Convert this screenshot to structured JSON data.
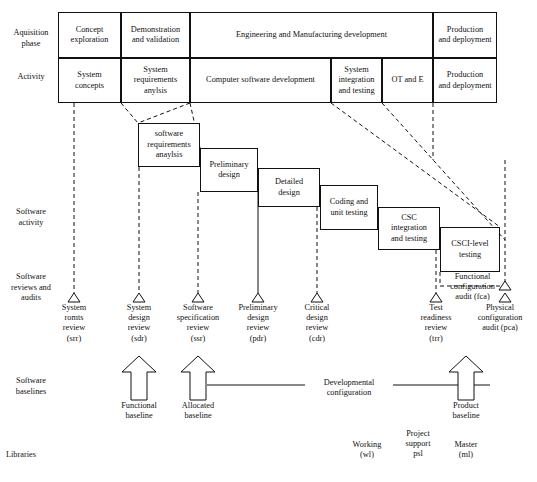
{
  "diagram": {
    "row_labels": {
      "acquisition_phase": "Aquisition\nphase",
      "activity": "Activity",
      "software_activity": "Software\nactivity",
      "reviews_audits": "Software\nreviews and\naudits",
      "baselines": "Software\nbaselines",
      "libraries": "Libraries"
    },
    "acquisition_phases": [
      {
        "label": "Concept\nexploration",
        "x": 58,
        "w": 63
      },
      {
        "label": "Demonstration\nand validation",
        "x": 121,
        "w": 69
      },
      {
        "label": "Engineering and Manufacturing development",
        "x": 190,
        "w": 243
      },
      {
        "label": "Production\nand deployment",
        "x": 433,
        "w": 64
      }
    ],
    "activities": [
      {
        "label": "System\nconcepts",
        "x": 58,
        "w": 63
      },
      {
        "label": "System\nrequirements\nanylsis",
        "x": 121,
        "w": 69
      },
      {
        "label": "Computer software development",
        "x": 190,
        "w": 141
      },
      {
        "label": "System\nintegration\nand testing",
        "x": 331,
        "w": 51
      },
      {
        "label": "OT and E",
        "x": 382,
        "w": 51
      },
      {
        "label": "Production\nand deployment",
        "x": 433,
        "w": 64
      }
    ],
    "software_activities": [
      {
        "label": "software\nrequirements\nanaylsis",
        "x": 138,
        "y": 123,
        "w": 62,
        "h": 44
      },
      {
        "label": "Preliminary\ndesign",
        "x": 200,
        "y": 148,
        "w": 58,
        "h": 44
      },
      {
        "label": "Detailed\ndesign",
        "x": 258,
        "y": 168,
        "w": 62,
        "h": 39
      },
      {
        "label": "Coding and\nunit testing",
        "x": 320,
        "y": 185,
        "w": 58,
        "h": 45
      },
      {
        "label": "CSC\nintegration\nand testing",
        "x": 378,
        "y": 207,
        "w": 62,
        "h": 43
      },
      {
        "label": "CSCI-level\ntesting",
        "x": 440,
        "y": 227,
        "w": 60,
        "h": 45
      }
    ],
    "reviews": [
      {
        "label": "System\nromts\nreview\n(srr)",
        "x": 74,
        "y": 303
      },
      {
        "label": "System\ndesign\nreview\n(sdr)",
        "x": 139,
        "y": 303
      },
      {
        "label": "Software\nspecification\nreview\n(ssr)",
        "x": 198,
        "y": 303
      },
      {
        "label": "Preliminary\ndesign\nreview\n(pdr)",
        "x": 258,
        "y": 303
      },
      {
        "label": "Critical\ndesign\nreview\n(cdr)",
        "x": 317,
        "y": 303
      },
      {
        "label": "Test\nreadiness\nreview\n(trr)",
        "x": 436,
        "y": 303
      },
      {
        "label": "Physical\nconfiguration\naudit (pca)",
        "x": 500,
        "y": 303
      }
    ],
    "fca_label": "Functional\nconfiguration\naudit (fca)",
    "baselines": [
      {
        "label": "Functional\nbaseline",
        "x": 139
      },
      {
        "label": "Allocated\nbaseline",
        "x": 198
      },
      {
        "label": "Product\nbaseline",
        "x": 466
      }
    ],
    "developmental_configuration": "Developmental\nconfiguration",
    "libraries": [
      {
        "label": "Working\n(wl)",
        "x": 367
      },
      {
        "label": "Project\nsupport\npsl",
        "x": 418
      },
      {
        "label": "Master\n(ml)",
        "x": 466
      }
    ],
    "colors": {
      "stroke": "#111111",
      "background": "#ffffff"
    }
  }
}
